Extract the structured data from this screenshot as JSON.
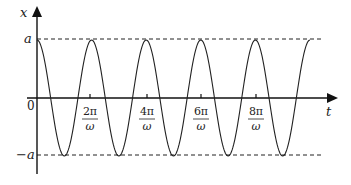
{
  "chart_data": {
    "type": "line",
    "title": "",
    "xlabel": "t",
    "ylabel": "x",
    "function": "x = a cos(ωt)",
    "x_ticks": [
      "2π/ω",
      "4π/ω",
      "6π/ω",
      "8π/ω"
    ],
    "origin_label": "0",
    "y_ticks": [
      "a",
      "−a"
    ],
    "reference_lines": [
      {
        "label": "a",
        "value": 1,
        "style": "dashed"
      },
      {
        "label": "−a",
        "value": -1,
        "style": "dashed"
      }
    ],
    "x_range_periods": [
      0,
      5
    ],
    "ylim": [
      -1,
      1
    ],
    "samples": {
      "x_in_periods": [
        0,
        0.25,
        0.5,
        0.75,
        1,
        1.25,
        1.5,
        1.75,
        2,
        2.25,
        2.5,
        2.75,
        3,
        3.25,
        3.5,
        3.75,
        4,
        4.25,
        4.5,
        4.75,
        5
      ],
      "y_over_a": [
        1,
        0,
        -1,
        0,
        1,
        0,
        -1,
        0,
        1,
        0,
        -1,
        0,
        1,
        0,
        -1,
        0,
        1,
        0,
        -1,
        0,
        1
      ]
    },
    "grid": false,
    "legend": null
  },
  "labels": {
    "x_axis": "t",
    "y_axis": "x",
    "origin": "0",
    "a_pos": "a",
    "a_neg": "−a",
    "ticks": [
      {
        "num": "2π",
        "den": "ω"
      },
      {
        "num": "4π",
        "den": "ω"
      },
      {
        "num": "6π",
        "den": "ω"
      },
      {
        "num": "8π",
        "den": "ω"
      }
    ]
  }
}
